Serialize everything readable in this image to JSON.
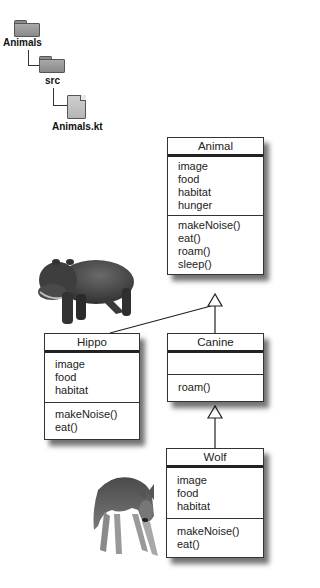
{
  "file_tree": {
    "root_folder": "Animals",
    "sub_folder": "src",
    "file": "Animals.kt"
  },
  "classes": {
    "animal": {
      "name": "Animal",
      "attributes": [
        "image",
        "food",
        "habitat",
        "hunger"
      ],
      "methods": [
        "makeNoise()",
        "eat()",
        "roam()",
        "sleep()"
      ]
    },
    "hippo": {
      "name": "Hippo",
      "attributes": [
        "image",
        "food",
        "habitat"
      ],
      "methods": [
        "makeNoise()",
        "eat()"
      ]
    },
    "canine": {
      "name": "Canine",
      "attributes": [],
      "methods": [
        "roam()"
      ]
    },
    "wolf": {
      "name": "Wolf",
      "attributes": [
        "image",
        "food",
        "habitat"
      ],
      "methods": [
        "makeNoise()",
        "eat()"
      ]
    }
  },
  "relationships": [
    {
      "from": "Hippo",
      "to": "Animal",
      "type": "inheritance"
    },
    {
      "from": "Canine",
      "to": "Animal",
      "type": "inheritance"
    },
    {
      "from": "Wolf",
      "to": "Canine",
      "type": "inheritance"
    }
  ],
  "images": {
    "hippo": "hippo-photo",
    "wolf": "wolf-photo"
  }
}
